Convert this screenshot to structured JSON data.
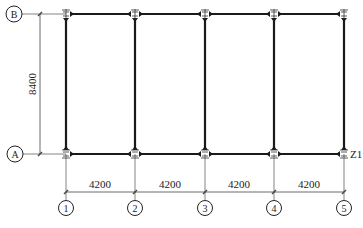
{
  "drawing": {
    "type": "structural frame plan",
    "row_axes": [
      {
        "label": "B",
        "y": 14
      },
      {
        "label": "A",
        "y": 154
      }
    ],
    "column_axes": [
      {
        "label": "1",
        "x": 66
      },
      {
        "label": "2",
        "x": 135
      },
      {
        "label": "3",
        "x": 205
      },
      {
        "label": "4",
        "x": 274
      },
      {
        "label": "5",
        "x": 344
      }
    ],
    "vertical_dimension": {
      "label": "8400"
    },
    "horizontal_dimensions": [
      {
        "label": "4200"
      },
      {
        "label": "4200"
      },
      {
        "label": "4200"
      },
      {
        "label": "4200"
      }
    ],
    "column_tag": "Z1",
    "colors": {
      "line": "#222222",
      "axis_line": "#555555"
    }
  }
}
